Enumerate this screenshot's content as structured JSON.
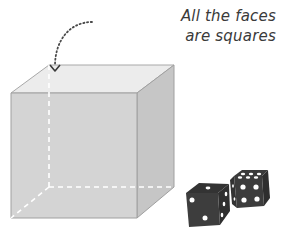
{
  "annotation": {
    "line1": "All the faces",
    "line2": "are squares"
  },
  "figure": {
    "hidden_edges": "dashed",
    "colors": {
      "front_face": "#d3d3d3",
      "top_face": "#ebebeb",
      "right_face": "#c4c4c4",
      "edge": "#9a9a9a",
      "hidden_edge": "#ffffff",
      "arrow": "#4a4a4a",
      "dice_body": "#3c3c3c",
      "dice_pip": "#ffffff"
    }
  },
  "dice": [
    {
      "name": "die-left",
      "top_pips": 1,
      "front_pips": 2,
      "right_pips": 3
    },
    {
      "name": "die-right",
      "top_pips": 6,
      "front_pips": 4,
      "left_pips": 2
    }
  ]
}
